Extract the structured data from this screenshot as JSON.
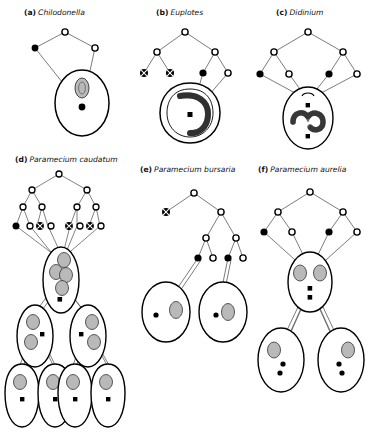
{
  "figure": {
    "background": "#ffffff",
    "ink": "#000000",
    "line_color": "#5a5a5a",
    "nucleus_fill": "#b9b9b9",
    "panels": [
      {
        "id": "a",
        "tag": "(a)",
        "species": "Chilodonella",
        "caption": "(a) Chilodonella",
        "node_counts": {
          "open": 3,
          "filled": 1,
          "crossed": 0
        },
        "cells": 1,
        "macronuclei_per_cell": 1,
        "micronuclei_per_cell": 1,
        "cell_shape": "oval"
      },
      {
        "id": "b",
        "tag": "(b)",
        "species": "Euplotes",
        "caption": "(b) Euplotes",
        "node_counts": {
          "open": 4,
          "filled": 1,
          "crossed": 2
        },
        "cells": 1,
        "macronuclei_per_cell": 1,
        "micronuclei_per_cell": 1,
        "cell_shape": "rounded-band"
      },
      {
        "id": "c",
        "tag": "(c)",
        "species": "Didinium",
        "caption": "(c) Didinium",
        "node_counts": {
          "open": 5,
          "filled": 2,
          "crossed": 0
        },
        "cells": 1,
        "macronuclei_per_cell": 1,
        "micronuclei_per_cell": 2,
        "cell_shape": "oval-barrel"
      },
      {
        "id": "d",
        "tag": "(d)",
        "species": "Paramecium caudatum",
        "caption": "(d) Paramecium caudatum",
        "node_counts": {
          "open": 10,
          "filled": 1,
          "crossed": 3
        },
        "cells": 7,
        "macronuclei_per_cell": 4,
        "micronuclei_per_cell": 1,
        "cell_shape": "slipper",
        "division_generations": [
          1,
          2,
          4
        ]
      },
      {
        "id": "e",
        "tag": "(e)",
        "species": "Paramecium bursaria",
        "caption": "(e) Paramecium bursaria",
        "node_counts": {
          "open": 5,
          "filled": 2,
          "crossed": 1
        },
        "cells": 2,
        "macronuclei_per_cell": 1,
        "micronuclei_per_cell": 1,
        "cell_shape": "oval"
      },
      {
        "id": "f",
        "tag": "(f)",
        "species": "Paramecium aurelia",
        "caption": "(f) Paramecium aurelia",
        "node_counts": {
          "open": 5,
          "filled": 2,
          "crossed": 0
        },
        "cells": 3,
        "macronuclei_per_cell": 2,
        "micronuclei_per_cell": 2,
        "cell_shape": "oval",
        "division_generations": [
          1,
          2
        ]
      }
    ],
    "legend_symbols": [
      {
        "name": "open-circle",
        "meaning": "open nucleus"
      },
      {
        "name": "filled-circle",
        "meaning": "filled nucleus"
      },
      {
        "name": "crossed-circle",
        "meaning": "degenerating nucleus"
      }
    ]
  }
}
